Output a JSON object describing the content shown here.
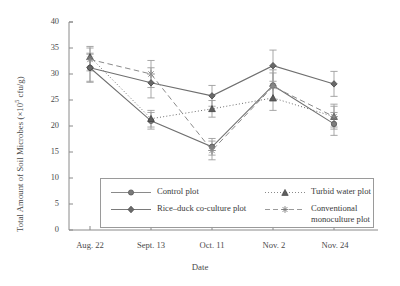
{
  "chart_data": {
    "type": "line",
    "title": "",
    "xlabel": "Date",
    "ylabel": "Total Amount of Soil Microbes (×10⁵ cfu/g)",
    "ylabel_main": "Total Amount of Soil Microbes (×10",
    "ylabel_exp": "5",
    "ylabel_tail": " cfu/g)",
    "categories": [
      "Aug. 22",
      "Sept. 13",
      "Oct. 11",
      "Nov. 2",
      "Nov. 24"
    ],
    "ylim": [
      0,
      40
    ],
    "yticks": [
      0,
      5,
      10,
      15,
      20,
      25,
      30,
      35,
      40
    ],
    "grid": false,
    "legend_position": "inside-bottom-center",
    "error_bars": true,
    "series": [
      {
        "name": "Control plot",
        "marker": "circle",
        "linestyle": "solid",
        "color": "#6f6f6f",
        "values": [
          31.2,
          21.0,
          16.0,
          27.8,
          20.4
        ],
        "errors": [
          2.6,
          1.6,
          1.6,
          3.0,
          2.2
        ]
      },
      {
        "name": "Rice–duck co-culture plot",
        "marker": "diamond",
        "linestyle": "solid",
        "color": "#6f6f6f",
        "values": [
          31.2,
          28.3,
          25.8,
          31.6,
          28.1
        ],
        "errors": [
          2.8,
          2.9,
          2.0,
          3.0,
          2.4
        ]
      },
      {
        "name": "Turbid water plot",
        "marker": "triangle",
        "linestyle": "dotted",
        "color": "#6f6f6f",
        "values": [
          33.3,
          21.4,
          23.3,
          25.4,
          21.8
        ],
        "errors": [
          2.0,
          1.6,
          1.6,
          2.4,
          2.0
        ]
      },
      {
        "name": "Conventional monoculture plot",
        "marker": "star",
        "linestyle": "dashed",
        "color": "#8a8a8a",
        "values": [
          32.8,
          30.0,
          15.3,
          27.6,
          21.8
        ],
        "errors": [
          2.2,
          2.6,
          1.8,
          2.6,
          2.4
        ]
      }
    ]
  },
  "legend": {
    "entries": [
      {
        "label": "Control plot",
        "marker": "circle",
        "style": "solid"
      },
      {
        "label": "Rice–duck co-culture plot",
        "marker": "diamond",
        "style": "solid"
      },
      {
        "label": "Turbid water plot",
        "marker": "triangle",
        "style": "dotted"
      },
      {
        "label": "Conventional",
        "label2": "monoculture plot",
        "marker": "star",
        "style": "dashed"
      }
    ]
  },
  "axis": {
    "y_ticks": [
      "40",
      "35",
      "30",
      "25",
      "20",
      "15",
      "10",
      "5",
      "0"
    ],
    "x_ticks": [
      "Aug. 22",
      "Sept. 13",
      "Oct. 11",
      "Nov. 2",
      "Nov. 24"
    ],
    "x_title": "Date"
  }
}
